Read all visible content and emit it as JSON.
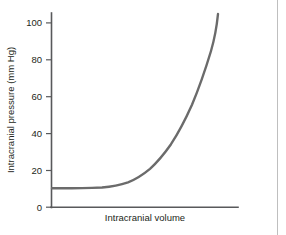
{
  "figure": {
    "background_color": "#ffffff",
    "divider_color": "#bfbfbf"
  },
  "chart_data": {
    "type": "line",
    "title": "",
    "subtitle": "",
    "xlabel": "Intracranial volume",
    "ylabel": "Intracranial pressure (mm Hg)",
    "xlim": [
      0,
      100
    ],
    "ylim": [
      0,
      100
    ],
    "grid": false,
    "legend": null,
    "legend_position": "none",
    "x_tick_labels": [],
    "y_tick_labels": [
      "0",
      "20",
      "40",
      "60",
      "80",
      "100"
    ],
    "y_ticks": [
      0,
      20,
      40,
      60,
      80,
      100
    ],
    "series": [
      {
        "name": "Intracranial pressure-volume curve",
        "color": "#6b6b6b",
        "x": [
          0,
          5,
          10,
          15,
          20,
          25,
          30,
          32,
          35,
          40,
          45,
          50,
          55,
          60,
          65,
          70,
          75,
          80,
          85,
          89
        ],
        "values": [
          10,
          10,
          10,
          10,
          10.2,
          10.5,
          11,
          11.5,
          12,
          14,
          17,
          21,
          26,
          32,
          40,
          50,
          62,
          76,
          90,
          100
        ]
      }
    ],
    "annotations": []
  },
  "curve_path": "M 52,188.2 L 62,188.2 L 72,188.2 L 82,188.1 L 92,187.9 L 102,187.5 C 112,186.6 120,185.0 128,182.3 C 136,179.2 143,174.6 150,168.8 C 157,162.4 164,154.2 171,144.2 C 178,133.6 185,120.4 192,104.8 C 199,88.0 206,67.6 211,51.0 C 214.5,39.0 217,24.0 218,14.0"
}
